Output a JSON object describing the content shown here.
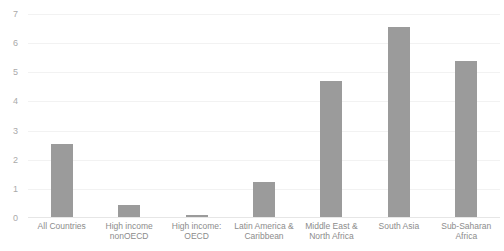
{
  "chart_data": {
    "type": "bar",
    "title": "",
    "xlabel": "",
    "ylabel": "",
    "ylim": [
      0,
      7
    ],
    "yticks": [
      "0",
      "1",
      "2",
      "3",
      "4",
      "5",
      "6",
      "7"
    ],
    "grid": true,
    "legend": "none",
    "bar_color": "#9b9b9b",
    "categories": [
      "All Countries",
      "High income nonOECD",
      "High income: OECD",
      "Latin America & Caribbean",
      "Middle East & North Africa",
      "South Asia",
      "Sub-Saharan Africa"
    ],
    "values": [
      2.55,
      0.45,
      0.1,
      1.24,
      4.7,
      6.55,
      5.4
    ]
  },
  "axis": {
    "y_labels": [
      "7",
      "6",
      "5",
      "4",
      "3",
      "2",
      "1",
      "0"
    ],
    "x_labels": [
      "All Countries",
      "High income nonOECD",
      "High income: OECD",
      "Latin America & Caribbean",
      "Middle East & North Africa",
      "South Asia",
      "Sub-Saharan Africa"
    ]
  }
}
